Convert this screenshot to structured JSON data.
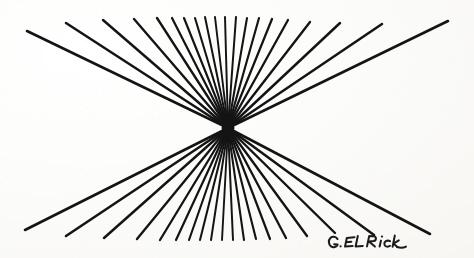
{
  "artwork": {
    "title": "Radiating Line Starburst",
    "medium_note": "pen and ink line drawing",
    "background_color": "#fbfbf9",
    "ink_color": "#141414",
    "canvas": {
      "width": 474,
      "height": 258
    },
    "convergence_point": {
      "x": 228,
      "y": 128
    },
    "signature": {
      "text": "G. ELRick",
      "display_text": "G. ELRick",
      "position": {
        "x": 326,
        "y": 230
      },
      "color": "#1b1b1b"
    }
  },
  "chart_data": {
    "type": "scatter",
    "xlabel": "",
    "ylabel": "",
    "xlim": [
      0,
      474
    ],
    "ylim": [
      0,
      258
    ],
    "grid": false,
    "legend": "none",
    "annotations": [
      "G. ELRick"
    ],
    "focus": {
      "x": 228,
      "y": 128
    },
    "ray_count_total": 33,
    "ray_count_upper": 17,
    "ray_count_lower": 16,
    "upper_endpoints": [
      {
        "x": 27,
        "y": 31
      },
      {
        "x": 66,
        "y": 23
      },
      {
        "x": 103,
        "y": 20
      },
      {
        "x": 134,
        "y": 19
      },
      {
        "x": 157,
        "y": 18
      },
      {
        "x": 172,
        "y": 18
      },
      {
        "x": 184,
        "y": 18
      },
      {
        "x": 195,
        "y": 18
      },
      {
        "x": 205,
        "y": 17
      },
      {
        "x": 215,
        "y": 17
      },
      {
        "x": 225,
        "y": 17
      },
      {
        "x": 236,
        "y": 17
      },
      {
        "x": 247,
        "y": 18
      },
      {
        "x": 259,
        "y": 18
      },
      {
        "x": 272,
        "y": 19
      },
      {
        "x": 288,
        "y": 20
      },
      {
        "x": 310,
        "y": 22
      },
      {
        "x": 340,
        "y": 23
      },
      {
        "x": 382,
        "y": 24
      },
      {
        "x": 448,
        "y": 21
      }
    ],
    "lower_endpoints": [
      {
        "x": 25,
        "y": 230
      },
      {
        "x": 66,
        "y": 236
      },
      {
        "x": 104,
        "y": 238
      },
      {
        "x": 137,
        "y": 239
      },
      {
        "x": 160,
        "y": 240
      },
      {
        "x": 176,
        "y": 240
      },
      {
        "x": 189,
        "y": 240
      },
      {
        "x": 200,
        "y": 240
      },
      {
        "x": 211,
        "y": 240
      },
      {
        "x": 222,
        "y": 240
      },
      {
        "x": 233,
        "y": 240
      },
      {
        "x": 244,
        "y": 240
      },
      {
        "x": 256,
        "y": 239
      },
      {
        "x": 270,
        "y": 239
      },
      {
        "x": 286,
        "y": 238
      },
      {
        "x": 307,
        "y": 236
      },
      {
        "x": 335,
        "y": 233
      },
      {
        "x": 374,
        "y": 235
      },
      {
        "x": 430,
        "y": 234
      }
    ],
    "stroke_widths": {
      "far_rays": 2.6,
      "mid_rays": 2.2,
      "near_rays": 1.9
    }
  }
}
